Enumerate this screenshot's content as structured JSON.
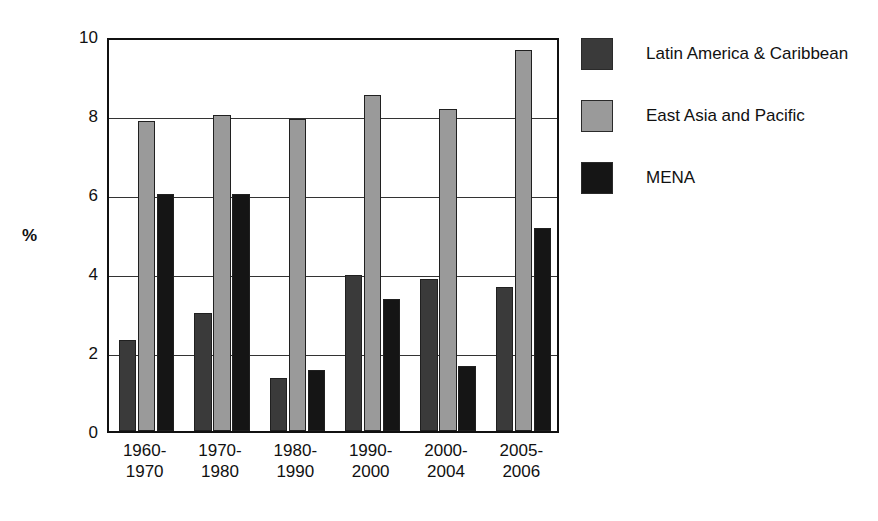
{
  "chart_data": {
    "type": "bar",
    "title": "",
    "xlabel": "",
    "ylabel": "%",
    "ylim": [
      0,
      10
    ],
    "yticks": [
      0,
      2,
      4,
      6,
      8,
      10
    ],
    "grid": true,
    "legend_position": "right",
    "categories": [
      "1960-\n1970",
      "1970-\n1980",
      "1980-\n1990",
      "1990-\n2000",
      "2000-\n2004",
      "2005-\n2006"
    ],
    "category_lines": [
      [
        "1960-",
        "1970"
      ],
      [
        "1970-",
        "1980"
      ],
      [
        "1980-",
        "1990"
      ],
      [
        "1990-",
        "2000"
      ],
      [
        "2000-",
        "2004"
      ],
      [
        "2005-",
        "2006"
      ]
    ],
    "series": [
      {
        "name": "Latin America & Caribbean",
        "color": "#3a3a3a",
        "values": [
          2.3,
          3.0,
          1.35,
          3.95,
          3.85,
          3.65
        ]
      },
      {
        "name": "East Asia and Pacific",
        "color": "#9a9a9a",
        "values": [
          7.85,
          8.0,
          7.9,
          8.5,
          8.15,
          9.65
        ]
      },
      {
        "name": "MENA",
        "color": "#151515",
        "values": [
          6.0,
          6.0,
          1.55,
          3.35,
          1.65,
          5.15
        ]
      }
    ]
  },
  "axis": {
    "y_title": "%",
    "y_tick_labels": [
      "10",
      "8",
      "6",
      "4",
      "2",
      "0"
    ]
  },
  "legend": {
    "entries": [
      {
        "label": "Latin America & Caribbean",
        "color": "#3a3a3a",
        "swatch": "legend-swatch-latin-america"
      },
      {
        "label": "East Asia and Pacific",
        "color": "#9a9a9a",
        "swatch": "legend-swatch-east-asia"
      },
      {
        "label": "MENA",
        "color": "#151515",
        "swatch": "legend-swatch-mena"
      }
    ]
  },
  "colors": {
    "axis": "#111111",
    "grid": "#333333",
    "background": "#ffffff"
  }
}
